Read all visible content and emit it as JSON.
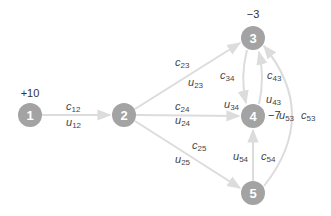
{
  "diagram": {
    "type": "network-flow-graph",
    "colors": {
      "node_fill": "#a3a3a3",
      "edge": "#dcdcdc",
      "node_text": "#ffffff",
      "label_text": "#444444"
    },
    "nodes": [
      {
        "id": "1",
        "label": "1",
        "supply": "+10",
        "x": 30,
        "y": 115
      },
      {
        "id": "2",
        "label": "2",
        "supply": "",
        "x": 124,
        "y": 115
      },
      {
        "id": "3",
        "label": "3",
        "supply": "−3",
        "x": 253,
        "y": 38
      },
      {
        "id": "4",
        "label": "4",
        "supply": "−7",
        "x": 253,
        "y": 116
      },
      {
        "id": "5",
        "label": "5",
        "supply": "",
        "x": 253,
        "y": 193
      }
    ],
    "edges": [
      {
        "from": "1",
        "to": "2",
        "cost": {
          "base": "c",
          "sub": "12"
        },
        "capacity": {
          "base": "u",
          "sub": "12"
        }
      },
      {
        "from": "2",
        "to": "3",
        "cost": {
          "base": "c",
          "sub": "23"
        },
        "capacity": {
          "base": "u",
          "sub": "23"
        }
      },
      {
        "from": "2",
        "to": "4",
        "cost": {
          "base": "c",
          "sub": "24"
        },
        "capacity": {
          "base": "u",
          "sub": "24"
        }
      },
      {
        "from": "2",
        "to": "5",
        "cost": {
          "base": "c",
          "sub": "25"
        },
        "capacity": {
          "base": "u",
          "sub": "25"
        }
      },
      {
        "from": "3",
        "to": "4",
        "cost": {
          "base": "c",
          "sub": "34"
        },
        "capacity": {
          "base": "u",
          "sub": "34"
        }
      },
      {
        "from": "4",
        "to": "3",
        "cost": {
          "base": "c",
          "sub": "43"
        },
        "capacity": {
          "base": "u",
          "sub": "43"
        }
      },
      {
        "from": "5",
        "to": "4",
        "cost": {
          "base": "c",
          "sub": "54"
        },
        "capacity": {
          "base": "u",
          "sub": "54"
        }
      },
      {
        "from": "5",
        "to": "3",
        "cost": {
          "base": "c",
          "sub": "53"
        },
        "capacity": {
          "base": "u",
          "sub": "53"
        }
      }
    ]
  }
}
